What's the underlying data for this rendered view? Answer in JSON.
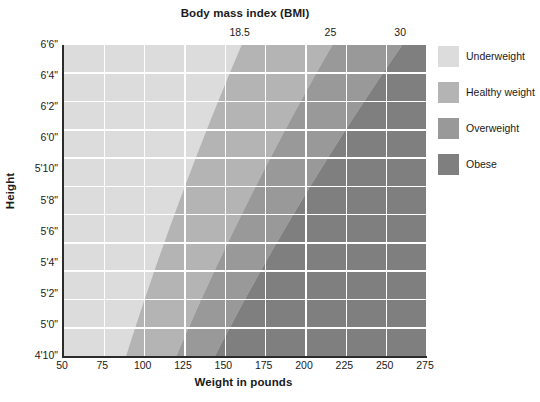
{
  "chart_data": {
    "type": "heatmap",
    "title": "Body mass index (BMI)",
    "xlabel": "Weight in pounds",
    "ylabel": "Height",
    "xlim": [
      50,
      275
    ],
    "ylim": [
      58,
      78
    ],
    "grid": true,
    "legend_position": "right",
    "x_ticks": [
      "50",
      "75",
      "100",
      "125",
      "150",
      "175",
      "200",
      "225",
      "250",
      "275"
    ],
    "x_tick_values": [
      50,
      75,
      100,
      125,
      150,
      175,
      200,
      225,
      250,
      275
    ],
    "y_ticks": [
      "6'6\"",
      "6'4\"",
      "6'2\"",
      "6'0\"",
      "5'10\"",
      "5'8\"",
      "5'6\"",
      "5'4\"",
      "5'2\"",
      "5'0\"",
      "4'10\""
    ],
    "y_tick_inches": [
      78,
      76,
      74,
      72,
      70,
      68,
      66,
      64,
      62,
      58.8
    ],
    "y_tick_inches_full": [
      78,
      76,
      74,
      72,
      70,
      68,
      66,
      64,
      62,
      60,
      58
    ],
    "bmi_boundary_labels": [
      "18.5",
      "25",
      "30"
    ],
    "bmi_boundary_values": [
      18.5,
      25,
      30
    ],
    "bmi_formula_constant": 703,
    "bands": [
      {
        "name": "Underweight",
        "bmi_min": 0,
        "bmi_max": 18.5,
        "color": "#dcdcdc"
      },
      {
        "name": "Healthy weight",
        "bmi_min": 18.5,
        "bmi_max": 25,
        "color": "#b4b4b4"
      },
      {
        "name": "Overweight",
        "bmi_min": 25,
        "bmi_max": 30,
        "color": "#999999"
      },
      {
        "name": "Obese",
        "bmi_min": 30,
        "bmi_max": 100,
        "color": "#7f7f7f"
      }
    ],
    "grid_color": "#ffffff",
    "axis_color": "#2b2b2b",
    "background": "#ffffff"
  },
  "legend": {
    "items": [
      {
        "label": "Underweight",
        "color": "#dcdcdc"
      },
      {
        "label": "Healthy weight",
        "color": "#b4b4b4"
      },
      {
        "label": "Overweight",
        "color": "#999999"
      },
      {
        "label": "Obese",
        "color": "#7f7f7f"
      }
    ]
  }
}
